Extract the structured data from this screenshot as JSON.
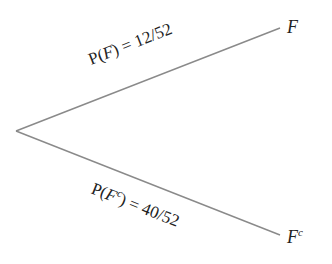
{
  "diagram": {
    "type": "probability-tree",
    "root": {
      "x": 16,
      "y": 131
    },
    "branches": [
      {
        "id": "upper",
        "to": {
          "x": 280,
          "y": 28
        },
        "outcome": "F",
        "outcome_sup": "",
        "probability_prefix": "P(",
        "probability_event": "F",
        "probability_event_sup": "",
        "probability_suffix": ") = 12/52",
        "probability_value": "12/52"
      },
      {
        "id": "lower",
        "to": {
          "x": 280,
          "y": 235
        },
        "outcome": "F",
        "outcome_sup": "c",
        "probability_prefix": "P(",
        "probability_event": "F",
        "probability_event_sup": "c",
        "probability_suffix": ") = 40/52",
        "probability_value": "40/52"
      }
    ],
    "colors": {
      "line": "#8a8a8a",
      "text": "#222222",
      "background": "#ffffff"
    }
  }
}
